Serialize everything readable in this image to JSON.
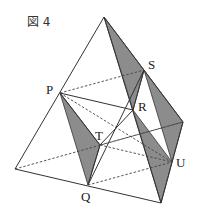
{
  "figure": {
    "title": "図 4",
    "labels": {
      "P": "P",
      "Q": "Q",
      "R": "R",
      "S": "S",
      "T": "T",
      "U": "U"
    },
    "colors": {
      "line": "#333333",
      "shade": "#8c8c8c",
      "background": "#ffffff"
    }
  }
}
